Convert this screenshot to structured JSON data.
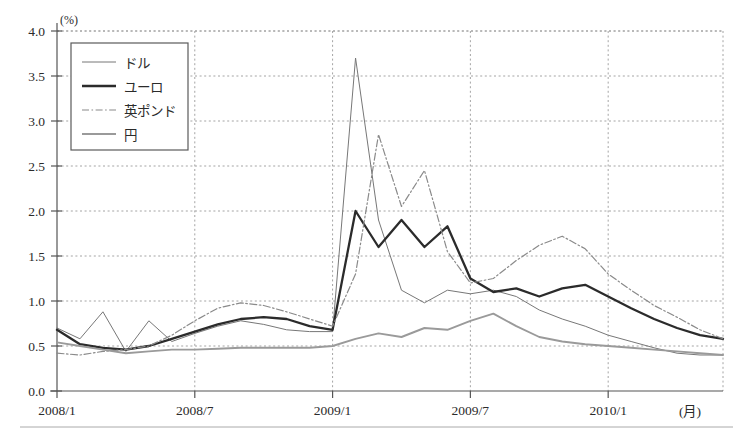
{
  "chart_data": {
    "type": "line",
    "title": "",
    "xlabel": "(月)",
    "ylabel": "(%)",
    "ylim": [
      0.0,
      4.0
    ],
    "ytick_labels": [
      "0.0",
      "0.5",
      "1.0",
      "1.5",
      "2.0",
      "2.5",
      "3.0",
      "3.5",
      "4.0"
    ],
    "ytick_values": [
      0.0,
      0.5,
      1.0,
      1.5,
      2.0,
      2.5,
      3.0,
      3.5,
      4.0
    ],
    "xtick_labels": [
      "2008/1",
      "2008/7",
      "2009/1",
      "2009/7",
      "2010/1"
    ],
    "xtick_index": [
      0,
      6,
      12,
      18,
      24
    ],
    "x_count": 30,
    "grid": true,
    "legend_position": "top-left",
    "legend_entries": [
      "ドル",
      "ユーロ",
      "英ポンド",
      "円"
    ],
    "series": [
      {
        "name": "ドル",
        "style": "solid-thin",
        "color": "#777777",
        "values": [
          0.7,
          0.58,
          0.88,
          0.44,
          0.78,
          0.55,
          0.64,
          0.72,
          0.78,
          0.74,
          0.68,
          0.66,
          0.66,
          3.7,
          1.9,
          1.12,
          0.98,
          1.12,
          1.08,
          1.12,
          1.05,
          0.9,
          0.8,
          0.72,
          0.62,
          0.55,
          0.48,
          0.42,
          0.4,
          0.4,
          0.38,
          0.36,
          0.3,
          0.26,
          0.25,
          0.25,
          0.26,
          0.3,
          0.36,
          0.38
        ]
      },
      {
        "name": "ユーロ",
        "style": "solid-thick",
        "color": "#2b2b2b",
        "values": [
          0.68,
          0.52,
          0.48,
          0.46,
          0.5,
          0.58,
          0.66,
          0.74,
          0.8,
          0.82,
          0.8,
          0.72,
          0.68,
          2.0,
          1.6,
          1.9,
          1.6,
          1.83,
          1.25,
          1.1,
          1.14,
          1.05,
          1.14,
          1.18,
          1.05,
          0.92,
          0.8,
          0.7,
          0.62,
          0.58,
          0.55,
          0.5,
          0.44,
          0.38,
          0.34,
          0.3,
          0.28,
          0.3,
          0.32,
          0.3
        ]
      },
      {
        "name": "英ポンド",
        "style": "dashdot",
        "color": "#8a8a8a",
        "values": [
          0.42,
          0.4,
          0.44,
          0.46,
          0.5,
          0.62,
          0.78,
          0.92,
          0.98,
          0.95,
          0.88,
          0.8,
          0.72,
          1.3,
          2.85,
          2.05,
          2.45,
          1.55,
          1.2,
          1.25,
          1.45,
          1.62,
          1.72,
          1.58,
          1.3,
          1.12,
          0.95,
          0.82,
          0.68,
          0.58,
          0.5,
          0.44,
          0.4,
          0.36,
          0.32,
          0.3,
          0.3,
          0.32,
          0.34,
          0.34
        ]
      },
      {
        "name": "円",
        "style": "solid-medium",
        "color": "#9a9a9a",
        "values": [
          0.54,
          0.5,
          0.46,
          0.42,
          0.44,
          0.46,
          0.46,
          0.47,
          0.48,
          0.48,
          0.48,
          0.48,
          0.5,
          0.58,
          0.64,
          0.6,
          0.7,
          0.68,
          0.78,
          0.86,
          0.72,
          0.6,
          0.55,
          0.52,
          0.5,
          0.48,
          0.46,
          0.44,
          0.42,
          0.4,
          0.38,
          0.36,
          0.34,
          0.32,
          0.3,
          0.28,
          0.27,
          0.28,
          0.28,
          0.28
        ]
      }
    ]
  }
}
